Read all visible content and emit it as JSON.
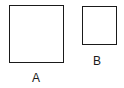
{
  "diagram": {
    "shapes": [
      {
        "id": "A",
        "type": "square",
        "label": "A",
        "x": 9,
        "y": 5,
        "w": 55,
        "h": 58
      },
      {
        "id": "B",
        "type": "square",
        "label": "B",
        "x": 82,
        "y": 6,
        "w": 35,
        "h": 39
      }
    ],
    "labels": {
      "a": "A",
      "b": "B"
    },
    "stroke_color": "#1a1a1a"
  }
}
